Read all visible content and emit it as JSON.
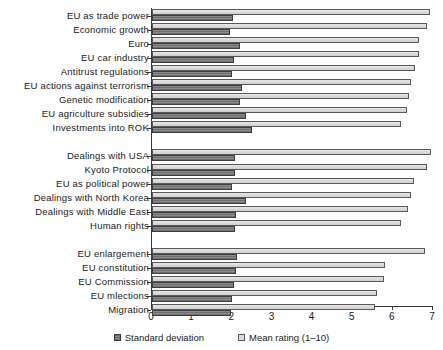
{
  "chart_data": {
    "type": "bar",
    "orientation": "horizontal",
    "title": "",
    "xlabel": "",
    "ylabel": "",
    "xlim": [
      0,
      7
    ],
    "grid": false,
    "legend_position": "bottom",
    "xticks": [
      "0",
      "1",
      "2",
      "3",
      "4",
      "5",
      "6",
      "7"
    ],
    "legend": [
      {
        "name": "Standard deviation",
        "swatch": "sd"
      },
      {
        "name": "Mean rating (1–10)",
        "swatch": "mean"
      }
    ],
    "series": [
      {
        "name": "Standard deviation",
        "key": "sd"
      },
      {
        "name": "Mean rating (1–10)",
        "key": "mean"
      }
    ],
    "groups": [
      {
        "name": "group-1",
        "categories": [
          "EU as trade power",
          "Economic growth",
          "Euro",
          "EU car industry",
          "Antitrust regulations",
          "EU actions against terrorism",
          "Genetic modification",
          "EU agriculture subsidies",
          "Investments into ROK"
        ],
        "mean": [
          6.92,
          6.86,
          6.64,
          6.66,
          6.56,
          6.45,
          6.41,
          6.34,
          6.2
        ],
        "sd": [
          2.02,
          1.95,
          2.2,
          2.05,
          2.0,
          2.25,
          2.18,
          2.34,
          2.5
        ]
      },
      {
        "name": "group-2",
        "categories": [
          "Dealings with USA",
          "Kyoto Protocol",
          "EU as political power",
          "Dealings with North Korea",
          "Dealings with Middle East",
          "Human rights"
        ],
        "mean": [
          6.96,
          6.86,
          6.53,
          6.46,
          6.38,
          6.2
        ],
        "sd": [
          2.07,
          2.07,
          2.0,
          2.34,
          2.1,
          2.07
        ]
      },
      {
        "name": "group-3",
        "categories": [
          "EU enlargement",
          "EU constitution",
          "EU Commission",
          "EU mlections",
          "Migration"
        ],
        "mean": [
          6.8,
          5.8,
          5.78,
          5.6,
          5.55
        ],
        "sd": [
          2.12,
          2.1,
          2.05,
          2.0,
          1.97
        ]
      }
    ]
  },
  "colors": {
    "mean_bar": "#d9d9d9",
    "sd_bar": "#6e6e6e",
    "axis": "#3a3a3a",
    "text": "#1a1a1a"
  }
}
